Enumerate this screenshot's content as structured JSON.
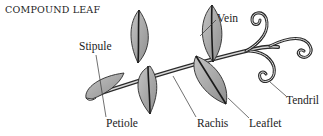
{
  "title": "COMPOUND LEAF",
  "labels": {
    "stipule": "Stipule",
    "petiole": "Petiole",
    "rachis": "Rachis",
    "leaflet": "Leaflet",
    "vein": "Vein",
    "tendril": "Tendril"
  },
  "caption": "",
  "colors": {
    "leaf_fill": "#a8a8a8",
    "outline": "#2a2a2a",
    "text": "#222222",
    "background": "#ffffff"
  }
}
